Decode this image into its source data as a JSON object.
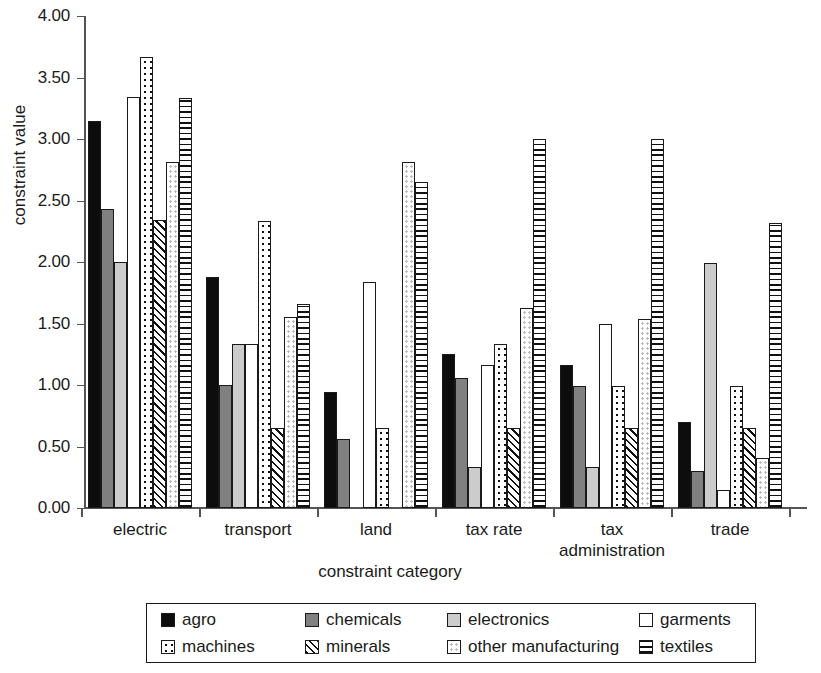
{
  "chart_data": {
    "type": "bar",
    "title": "",
    "xlabel": "constraint category",
    "ylabel": "constraint value",
    "ylim": [
      0,
      4.0
    ],
    "ytick_step": 0.5,
    "yticks": [
      "0.00",
      "0.50",
      "1.00",
      "1.50",
      "2.00",
      "2.50",
      "3.00",
      "3.50",
      "4.00"
    ],
    "grid": false,
    "legend_position": "bottom",
    "categories": [
      "electric",
      "transport",
      "land",
      "tax rate",
      "tax administration",
      "trade"
    ],
    "category_labels": [
      [
        "electric"
      ],
      [
        "transport"
      ],
      [
        "land"
      ],
      [
        "tax rate"
      ],
      [
        "tax",
        "administration"
      ],
      [
        "trade"
      ]
    ],
    "series": [
      {
        "name": "agro",
        "pattern": "solid-black",
        "color": "#0d0d0d",
        "values": [
          3.15,
          1.88,
          0.94,
          1.25,
          1.16,
          0.7
        ]
      },
      {
        "name": "chemicals",
        "pattern": "solid-dark-gray",
        "color": "#808080",
        "values": [
          2.43,
          1.0,
          0.56,
          1.06,
          0.99,
          0.3
        ]
      },
      {
        "name": "electronics",
        "pattern": "solid-light-gray",
        "color": "#cccccc",
        "values": [
          2.0,
          1.33,
          0.0,
          0.33,
          0.33,
          1.99
        ]
      },
      {
        "name": "garments",
        "pattern": "solid-white",
        "color": "#ffffff",
        "values": [
          3.34,
          1.33,
          1.84,
          1.16,
          1.5,
          0.15
        ]
      },
      {
        "name": "machines",
        "pattern": "dark-dots",
        "color": "#ffffff",
        "values": [
          3.67,
          2.33,
          0.65,
          1.33,
          0.99,
          0.99
        ]
      },
      {
        "name": "minerals",
        "pattern": "diagonal-hatch",
        "color": "#ffffff",
        "values": [
          2.34,
          0.65,
          0.0,
          0.65,
          0.65,
          0.65
        ]
      },
      {
        "name": "other manufacturing",
        "pattern": "light-dots",
        "color": "#ffffff",
        "values": [
          2.81,
          1.55,
          2.81,
          1.63,
          1.54,
          0.41
        ]
      },
      {
        "name": "textiles",
        "pattern": "horizontal-lines",
        "color": "#ffffff",
        "values": [
          3.33,
          1.66,
          2.65,
          3.0,
          3.0,
          2.32
        ]
      }
    ]
  }
}
